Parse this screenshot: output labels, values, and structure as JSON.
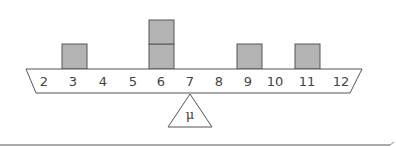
{
  "diagram": {
    "title": "",
    "beam": {
      "labels": [
        "2",
        "3",
        "4",
        "5",
        "6",
        "7",
        "8",
        "9",
        "10",
        "11",
        "12"
      ],
      "values": [
        2,
        3,
        4,
        5,
        6,
        7,
        8,
        9,
        10,
        11,
        12
      ]
    },
    "stacks": [
      {
        "value": 3,
        "count": 1
      },
      {
        "value": 6,
        "count": 2
      },
      {
        "value": 9,
        "count": 1
      },
      {
        "value": 11,
        "count": 1
      }
    ],
    "fulcrum": {
      "label": "μ",
      "position": 7
    },
    "colors": {
      "box_fill": "#b4b4b4",
      "box_stroke": "#555555",
      "line": "#555555",
      "text": "#444444",
      "background": "#ffffff"
    }
  }
}
